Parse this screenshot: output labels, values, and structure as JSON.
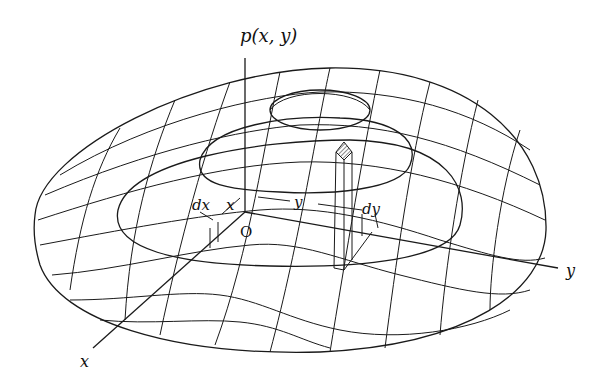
{
  "diagram": {
    "labels": {
      "z_axis": "p(x, y)",
      "x_axis": "x",
      "y_axis": "y",
      "origin": "O",
      "dx": "dx",
      "dy": "dy",
      "x_dim": "x",
      "y_dim": "y"
    },
    "elements": [
      "bell-shaped surface mesh",
      "vertical p(x,y) axis",
      "x axis",
      "y axis",
      "elemental column dx·dy with hatched top"
    ],
    "colors": {
      "stroke": "#1a1a1a",
      "background": "#ffffff"
    }
  }
}
